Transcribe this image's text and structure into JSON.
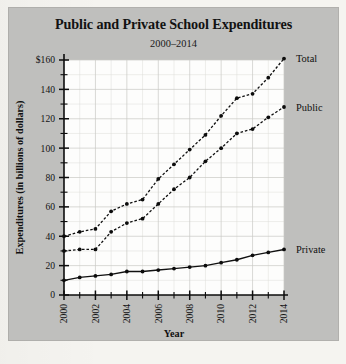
{
  "figure": {
    "title": "Public and Private School Expenditures",
    "subtitle": "2000–2014",
    "panel_color": "#bfbfbd",
    "plot_color": "#fdfdfc",
    "ink_color": "#101010"
  },
  "chart_data": {
    "type": "line",
    "title": "Public and Private School Expenditures",
    "subtitle": "2000–2014",
    "xlabel": "Year",
    "ylabel": "Expenditures (in billions of dollars)",
    "xlim": [
      2000,
      2014
    ],
    "ylim": [
      0,
      160
    ],
    "grid": true,
    "legend_position": "right-of-plot-at-line-ends",
    "y_major_ticks": [
      0,
      20,
      40,
      60,
      80,
      100,
      120,
      140,
      160
    ],
    "y_major_tick_labels": [
      "0",
      "20",
      "40",
      "60",
      "80",
      "100",
      "120",
      "140",
      "$160"
    ],
    "y_minor_tick_step": 10,
    "x_ticks": [
      2000,
      2001,
      2002,
      2003,
      2004,
      2005,
      2006,
      2007,
      2008,
      2009,
      2010,
      2011,
      2012,
      2013,
      2014
    ],
    "x_tick_labels": [
      "2000",
      "",
      "2002",
      "",
      "2004",
      "",
      "2006",
      "",
      "2008",
      "",
      "2010",
      "",
      "2012",
      "",
      "2014"
    ],
    "x_tick_label_rotation": -90,
    "x": [
      2000,
      2001,
      2002,
      2003,
      2004,
      2005,
      2006,
      2007,
      2008,
      2009,
      2010,
      2011,
      2012,
      2013,
      2014
    ],
    "series": [
      {
        "name": "Total",
        "label": "Total",
        "style": "dashed",
        "marker": "circle",
        "values": [
          40,
          43,
          45,
          57,
          62,
          65,
          79,
          89,
          99,
          109,
          122,
          134,
          137,
          148,
          161
        ]
      },
      {
        "name": "Public",
        "label": "Public",
        "style": "dashed",
        "marker": "circle",
        "values": [
          30,
          31,
          31,
          43,
          49,
          52,
          62,
          72,
          80,
          91,
          100,
          110,
          113,
          121,
          128
        ]
      },
      {
        "name": "Private",
        "label": "Private",
        "style": "solid",
        "marker": "circle",
        "values": [
          10,
          12,
          13,
          14,
          16,
          16,
          17,
          18,
          19,
          20,
          22,
          24,
          27,
          29,
          31
        ]
      }
    ]
  }
}
